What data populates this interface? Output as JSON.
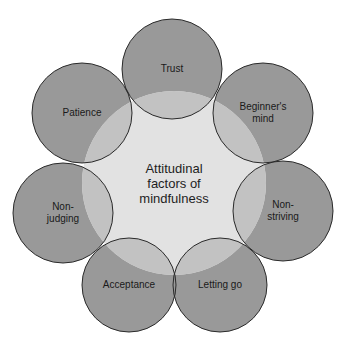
{
  "diagram": {
    "center": {
      "label": "Attitudinal\nfactors of\nmindfulness",
      "cx": 174,
      "cy": 183,
      "r": 92,
      "fill": "#e2e2e2"
    },
    "nodes": [
      {
        "label": "Trust",
        "cx": 172,
        "cy": 69,
        "r": 50
      },
      {
        "label": "Beginner's\nmind",
        "cx": 263,
        "cy": 113,
        "r": 50
      },
      {
        "label": "Non-\nstriving",
        "cx": 283,
        "cy": 211,
        "r": 50
      },
      {
        "label": "Letting go",
        "cx": 220,
        "cy": 285,
        "r": 47
      },
      {
        "label": "Acceptance",
        "cx": 129,
        "cy": 285,
        "r": 47
      },
      {
        "label": "Non-\njudging",
        "cx": 63,
        "cy": 213,
        "r": 50
      },
      {
        "label": "Patience",
        "cx": 82,
        "cy": 113,
        "r": 50
      }
    ],
    "colors": {
      "node_fill": "#999999",
      "overlap_fill": "#c2c2c2",
      "stroke": "#2a2a2a"
    }
  }
}
